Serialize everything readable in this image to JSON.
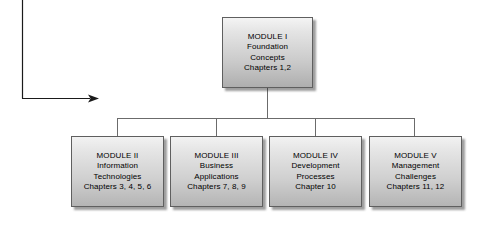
{
  "diagram": {
    "type": "hierarchy-tree",
    "canvas": {
      "width": 486,
      "height": 226,
      "background": "#ffffff"
    },
    "colors": {
      "box_border": "#5f5f5f",
      "box_fill_light": "#f2f2f2",
      "box_fill_dark": "#b4b4b4",
      "connector": "#6b6b6b",
      "arrow": "#1a1a1a",
      "text": "#000000"
    },
    "root": {
      "id": "module-1",
      "title": "MODULE I",
      "lines": [
        "MODULE I",
        "Foundation",
        "Concepts",
        "Chapters 1,2"
      ]
    },
    "children": [
      {
        "id": "module-2",
        "title": "MODULE II",
        "lines": [
          "MODULE II",
          "Information",
          "Technologies",
          "Chapters 3, 4, 5, 6"
        ]
      },
      {
        "id": "module-3",
        "title": "MODULE III",
        "lines": [
          "MODULE III",
          "Business",
          "Applications",
          "Chapters 7, 8, 9"
        ]
      },
      {
        "id": "module-4",
        "title": "MODULE IV",
        "lines": [
          "MODULE IV",
          "Development",
          "Processes",
          "Chapter 10"
        ]
      },
      {
        "id": "module-5",
        "title": "MODULE V",
        "lines": [
          "MODULE V",
          "Management",
          "Challenges",
          "Chapters 11, 12"
        ]
      }
    ],
    "connectors": {
      "root_stem": {
        "x": 267,
        "y1": 88,
        "y2": 118
      },
      "bus": {
        "y": 118,
        "x1": 117,
        "x2": 415
      },
      "drops": [
        {
          "x": 117,
          "y1": 118,
          "y2": 136
        },
        {
          "x": 216,
          "y1": 118,
          "y2": 136
        },
        {
          "x": 315,
          "y1": 118,
          "y2": 136
        },
        {
          "x": 415,
          "y1": 118,
          "y2": 136
        }
      ]
    },
    "callout_arrow": {
      "vertical": {
        "x": 22,
        "y1": 0,
        "y2": 98
      },
      "horizontal": {
        "y": 98,
        "x1": 22,
        "x2": 92
      },
      "head": {
        "x": 98,
        "y": 98,
        "direction": "right"
      }
    }
  }
}
